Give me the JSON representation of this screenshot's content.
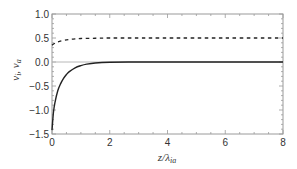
{
  "chart_data": {
    "type": "line",
    "title": "",
    "xlabel": "z/λ_ia",
    "xlabel_main": "z/λ",
    "xlabel_sub": "ia",
    "ylabel": "v_i, v_a",
    "xlim": [
      0,
      8
    ],
    "ylim": [
      -1.5,
      1.0
    ],
    "xticks": [
      "0",
      "2",
      "4",
      "6",
      "8"
    ],
    "yticks": [
      "1.0",
      "0.5",
      "0.0",
      "-0.5",
      "-1.0",
      "-1.5"
    ],
    "grid": false,
    "legend": null,
    "zero_line": true,
    "series": [
      {
        "name": "v_i",
        "style": "solid",
        "color": "#222222",
        "x": [
          0,
          0.05,
          0.1,
          0.2,
          0.3,
          0.4,
          0.5,
          0.6,
          0.8,
          1.0,
          1.2,
          1.5,
          2.0,
          3.0,
          4.0,
          6.0,
          8.0
        ],
        "values": [
          -1.42,
          -1.05,
          -0.85,
          -0.6,
          -0.45,
          -0.34,
          -0.26,
          -0.2,
          -0.12,
          -0.075,
          -0.045,
          -0.02,
          -0.006,
          0.0,
          0.0,
          0.0,
          0.0
        ]
      },
      {
        "name": "v_a",
        "style": "dashed",
        "color": "#222222",
        "x": [
          0,
          0.1,
          0.2,
          0.4,
          0.6,
          0.8,
          1.0,
          1.5,
          2.0,
          3.0,
          4.0,
          6.0,
          8.0
        ],
        "values": [
          0.35,
          0.39,
          0.42,
          0.45,
          0.47,
          0.48,
          0.49,
          0.495,
          0.5,
          0.5,
          0.5,
          0.5,
          0.5
        ]
      }
    ]
  }
}
